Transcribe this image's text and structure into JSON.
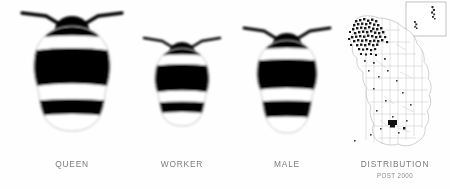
{
  "figure": {
    "background_color": "#fefefe",
    "label_color": "#7b7b7b",
    "body_color": "#000000",
    "band_color": "#ffffff",
    "outline_color": "#b9b9b9"
  },
  "panels": [
    {
      "id": "queen",
      "caption": "QUEEN",
      "subcaption": "",
      "type": "bee",
      "scale": 1.0
    },
    {
      "id": "worker",
      "caption": "WORKER",
      "subcaption": "",
      "type": "bee",
      "scale": 0.72
    },
    {
      "id": "male",
      "caption": "MALE",
      "subcaption": "",
      "type": "bee",
      "scale": 0.82
    },
    {
      "id": "distribution",
      "caption": "DISTRIBUTION",
      "subcaption": "POST 2000",
      "type": "map",
      "region": "United Kingdom",
      "inset_label": "northern isles inset"
    }
  ],
  "map": {
    "inset_present": true,
    "dense_record_region": "northern Scotland",
    "sparse_record_region": "southern England"
  }
}
